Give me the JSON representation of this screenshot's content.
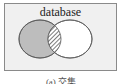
{
  "diagram": {
    "type": "venn",
    "title": "database",
    "caption": "(a) 交集",
    "sets": [
      {
        "name": "left-set",
        "fill": "#bdbdbd",
        "stroke": "#555555"
      },
      {
        "name": "right-set",
        "fill": "#ffffff",
        "stroke": "#555555"
      }
    ],
    "highlighted_region": "intersection",
    "highlight_pattern": "diagonal-hatch",
    "background": "#f0f0f0",
    "border": "#8a8a8a"
  }
}
